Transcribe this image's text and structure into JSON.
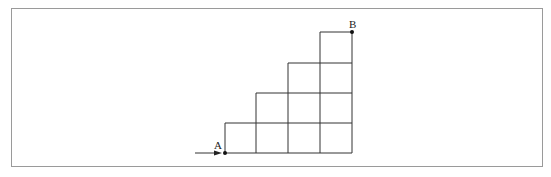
{
  "diagram": {
    "type": "staircase-grid",
    "start_label": "A",
    "end_label": "B",
    "columns": 4,
    "rows": 4,
    "column_heights": [
      1,
      2,
      3,
      4
    ],
    "line_color": "#333333",
    "frame_color": "#9a9a9a"
  }
}
